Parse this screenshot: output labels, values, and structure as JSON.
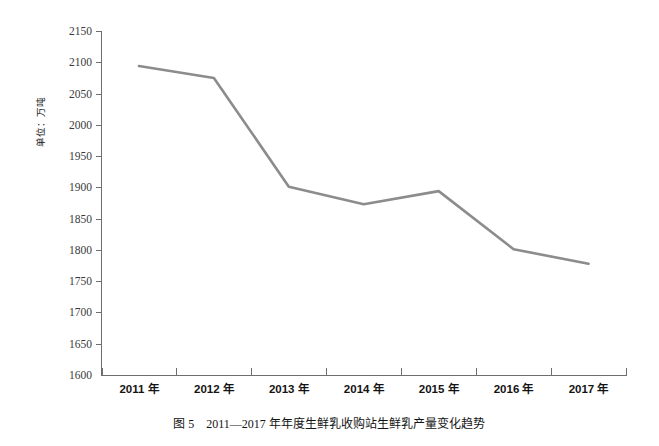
{
  "figure": {
    "caption_number": "图 5",
    "caption_text": "2011—2017 年年度生鲜乳收购站生鲜乳产量变化趋势",
    "caption_full": "图 5　2011—2017 年年度生鲜乳收购站生鲜乳产量变化趋势",
    "y_axis_title": "单位：万吨",
    "line_color": "#8c8c8c",
    "axis_color": "#6e6e6e",
    "background_color": "#ffffff"
  },
  "chart_data": {
    "type": "line",
    "title": "2011—2017 年年度生鲜乳收购站生鲜乳产量变化趋势",
    "xlabel": "",
    "ylabel": "单位：万吨",
    "categories": [
      "2011 年",
      "2012 年",
      "2013 年",
      "2014 年",
      "2015 年",
      "2016 年",
      "2017 年"
    ],
    "x": [
      2011,
      2012,
      2013,
      2014,
      2015,
      2016,
      2017
    ],
    "values": [
      2094,
      2075,
      1901,
      1873,
      1894,
      1801,
      1778
    ],
    "ylim": [
      1600,
      2150
    ],
    "yticks": [
      1600,
      1650,
      1700,
      1750,
      1800,
      1850,
      1900,
      1950,
      2000,
      2050,
      2100,
      2150
    ],
    "ytick_labels": [
      "1600",
      "1650",
      "1700",
      "1750",
      "1800",
      "1850",
      "1900",
      "1950",
      "2000",
      "2050",
      "2100",
      "2150"
    ],
    "grid": false,
    "legend": null,
    "series": [
      {
        "name": "生鲜乳收购站生鲜乳产量",
        "values": [
          2094,
          2075,
          1901,
          1873,
          1894,
          1801,
          1778
        ],
        "color": "#8c8c8c"
      }
    ]
  }
}
